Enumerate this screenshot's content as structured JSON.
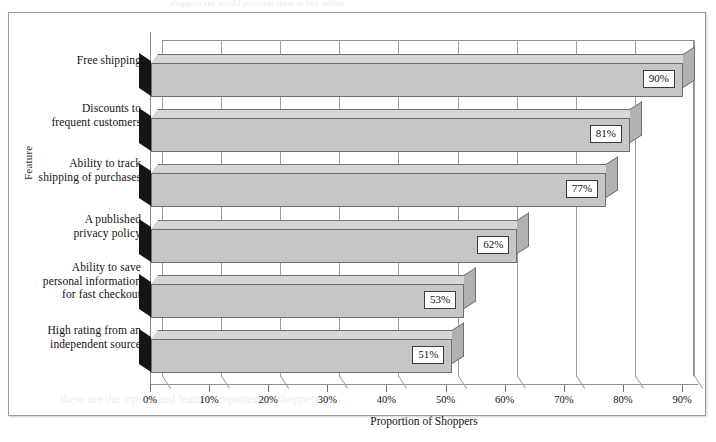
{
  "page": {
    "caption_remnant": "shoppers say would persuade them to buy online",
    "bleed_ghost": "these are the top-ranked features reported by shoppers"
  },
  "chart_data": {
    "type": "bar",
    "orientation": "horizontal",
    "title": "",
    "subtitle": "",
    "xlabel": "Proportion of Shoppers",
    "ylabel": "Feature",
    "categories": [
      "Free shipping",
      "Discounts to frequent customers",
      "Ability to track shipping of purchases",
      "A published privacy policy",
      "Ability to save personal information for fast checkout",
      "High rating from an independent source"
    ],
    "category_lines": [
      [
        "Free shipping"
      ],
      [
        "Discounts to",
        "frequent customers"
      ],
      [
        "Ability to track",
        "shipping of purchases"
      ],
      [
        "A published",
        "privacy policy"
      ],
      [
        "Ability to save",
        "personal information",
        "for fast checkout"
      ],
      [
        "High rating from an",
        "independent source"
      ]
    ],
    "values": [
      90,
      81,
      77,
      62,
      53,
      51
    ],
    "value_labels": [
      "90%",
      "81%",
      "77%",
      "62%",
      "53%",
      "51%"
    ],
    "xlim": [
      0,
      90
    ],
    "xticks": [
      0,
      10,
      20,
      30,
      40,
      50,
      60,
      70,
      80,
      90
    ],
    "xtick_labels": [
      "0%",
      "10%",
      "20%",
      "30%",
      "40%",
      "50%",
      "60%",
      "70%",
      "80%",
      "90%"
    ],
    "grid": true,
    "grid_axis": "x",
    "legend": false,
    "style_3d": true,
    "colors": {
      "bar_face": "#c6c6c6",
      "bar_top": "#d6d6d6",
      "bar_side": "#b1b1b1",
      "bar_edge": "#6e6e6e",
      "wedge": "#151515",
      "gridline": "#9f9f9f",
      "axis": "#8d8d8d",
      "plot_background": "#ffffff",
      "page_background": "#ffffff",
      "border": "#9a9a9a",
      "text": "#111111"
    }
  }
}
